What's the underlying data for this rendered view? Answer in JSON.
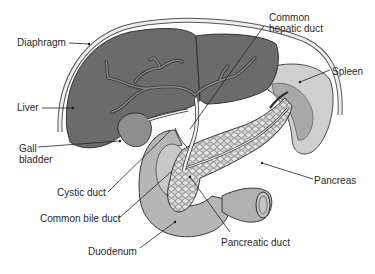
{
  "diagram": {
    "type": "anatomical-illustration",
    "colors": {
      "liver": "#6b6b6b",
      "gallbladder": "#8a8a8a",
      "diaphragm": "#e8e8e8",
      "spleen": "#c8c8c8",
      "duodenum": "#b4b4b4",
      "pancreas": "#d0d0d0",
      "ducts": "#f2f2f2",
      "outline": "#3a3a3a",
      "label_text": "#2a2a2a"
    },
    "labels": {
      "diaphragm": "Diaphragm",
      "liver": "Liver",
      "gallbladder_1": "Gall",
      "gallbladder_2": "bladder",
      "cystic_duct": "Cystic duct",
      "common_bile_duct": "Common bile duct",
      "duodenum": "Duodenum",
      "common_hepatic_duct_1": "Common",
      "common_hepatic_duct_2": "hepatic duct",
      "spleen": "Spleen",
      "pancreas": "Pancreas",
      "pancreatic_duct": "Pancreatic duct"
    }
  }
}
